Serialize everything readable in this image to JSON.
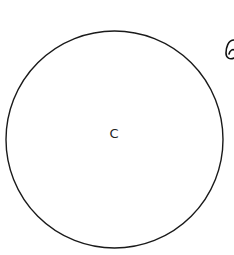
{
  "diagram": {
    "circle": {
      "label": "C",
      "cx": 114.5,
      "cy": 139.5,
      "r": 108.5,
      "stroke": "#1a1a1a"
    },
    "partial_glyph": {
      "description": "partially visible handwritten letter at right edge",
      "stroke": "#111111"
    }
  }
}
